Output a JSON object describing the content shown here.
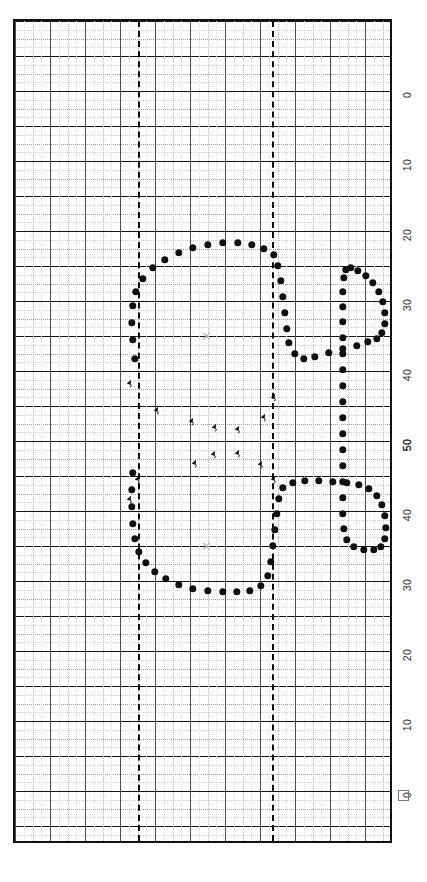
{
  "chart_data": {
    "type": "scatter",
    "title": "",
    "subtitle": "",
    "xlabel": "",
    "ylabel": "",
    "orientation": "rotated-90",
    "grid": true,
    "legend": false,
    "axis": {
      "position": "right",
      "tick_labels": [
        "0",
        "10",
        "20",
        "30",
        "40",
        "50",
        "50",
        "40",
        "30",
        "20",
        "10",
        "0"
      ],
      "tick_positions_px": [
        95,
        165,
        235,
        305,
        375,
        445,
        445,
        515,
        585,
        655,
        725,
        795
      ],
      "range_description": "0 to 50 and back to 0 (mirrored degrees scale)"
    },
    "series": [
      {
        "name": "isopter-boundary",
        "marker": "filled-circle",
        "color": "#111111",
        "points_px": [
          [
            133,
            357
          ],
          [
            131,
            338
          ],
          [
            130,
            321
          ],
          [
            131,
            304
          ],
          [
            134,
            290
          ],
          [
            141,
            277
          ],
          [
            151,
            266
          ],
          [
            163,
            258
          ],
          [
            177,
            251
          ],
          [
            191,
            246
          ],
          [
            206,
            243
          ],
          [
            221,
            241
          ],
          [
            236,
            241
          ],
          [
            250,
            243
          ],
          [
            262,
            247
          ],
          [
            272,
            253
          ],
          [
            276,
            264
          ],
          [
            279,
            279
          ],
          [
            281,
            295
          ],
          [
            283,
            311
          ],
          [
            285,
            327
          ],
          [
            287,
            341
          ],
          [
            293,
            352
          ],
          [
            302,
            357
          ],
          [
            313,
            355
          ],
          [
            327,
            351
          ],
          [
            341,
            347
          ],
          [
            355,
            344
          ],
          [
            366,
            340
          ],
          [
            375,
            337
          ],
          [
            380,
            331
          ],
          [
            383,
            322
          ],
          [
            383,
            311
          ],
          [
            381,
            300
          ],
          [
            377,
            290
          ],
          [
            371,
            281
          ],
          [
            364,
            274
          ],
          [
            356,
            269
          ],
          [
            349,
            266
          ],
          [
            344,
            268
          ],
          [
            342,
            276
          ],
          [
            341,
            290
          ],
          [
            341,
            305
          ],
          [
            341,
            320
          ],
          [
            341,
            336
          ],
          [
            341,
            352
          ],
          [
            341,
            368
          ],
          [
            341,
            384
          ],
          [
            341,
            400
          ],
          [
            341,
            416
          ],
          [
            341,
            432
          ],
          [
            341,
            448
          ],
          [
            341,
            464
          ],
          [
            341,
            480
          ],
          [
            341,
            496
          ],
          [
            341,
            512
          ],
          [
            342,
            527
          ],
          [
            345,
            538
          ],
          [
            352,
            545
          ],
          [
            362,
            548
          ],
          [
            372,
            548
          ],
          [
            379,
            545
          ],
          [
            383,
            537
          ],
          [
            384,
            526
          ],
          [
            383,
            514
          ],
          [
            380,
            503
          ],
          [
            375,
            494
          ],
          [
            367,
            487
          ],
          [
            357,
            483
          ],
          [
            345,
            481
          ],
          [
            331,
            480
          ],
          [
            317,
            479
          ],
          [
            303,
            479
          ],
          [
            291,
            481
          ],
          [
            281,
            486
          ],
          [
            277,
            497
          ],
          [
            275,
            512
          ],
          [
            273,
            528
          ],
          [
            271,
            544
          ],
          [
            269,
            560
          ],
          [
            266,
            574
          ],
          [
            259,
            584
          ],
          [
            248,
            589
          ],
          [
            235,
            590
          ],
          [
            221,
            590
          ],
          [
            206,
            589
          ],
          [
            191,
            587
          ],
          [
            177,
            583
          ],
          [
            164,
            577
          ],
          [
            153,
            570
          ],
          [
            144,
            561
          ],
          [
            137,
            550
          ],
          [
            133,
            537
          ],
          [
            131,
            522
          ],
          [
            130,
            505
          ],
          [
            130,
            488
          ],
          [
            131,
            471
          ]
        ]
      },
      {
        "name": "scotoma-markers",
        "marker": "small-arrow",
        "color": "#111111",
        "points_px": [
          [
            128,
            382
          ],
          [
            155,
            409
          ],
          [
            190,
            420
          ],
          [
            213,
            426
          ],
          [
            236,
            428
          ],
          [
            262,
            416
          ],
          [
            272,
            396
          ],
          [
            193,
            462
          ],
          [
            212,
            453
          ],
          [
            236,
            452
          ],
          [
            259,
            463
          ],
          [
            272,
            478
          ],
          [
            136,
            478
          ],
          [
            128,
            498
          ]
        ]
      },
      {
        "name": "fixation-points",
        "marker": "cross-x",
        "color": "#b9b9b9",
        "points_px": [
          [
            204,
            334
          ],
          [
            204,
            544
          ]
        ]
      }
    ],
    "grid_spec": {
      "major_h_spacing_px": 35,
      "minor_h_spacing_px": 17.5,
      "major_v_spacing_px": 35,
      "meridian_x_px": [
        136,
        270
      ]
    }
  },
  "figure": {
    "registration_mark": "square-mark"
  }
}
